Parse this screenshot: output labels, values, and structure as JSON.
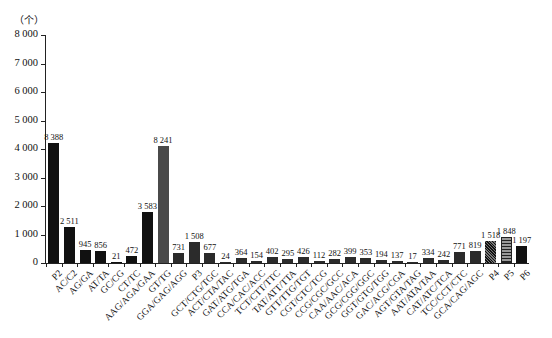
{
  "chart_data": {
    "type": "bar",
    "title": "",
    "xlabel": "",
    "ylabel": "（个）",
    "ylim": [
      0,
      8000
    ],
    "yticks": [
      "0",
      "1 000",
      "2 000",
      "3 000",
      "4 000",
      "5 000",
      "6 000",
      "7 000",
      "8 000"
    ],
    "grid": false,
    "legend": null,
    "note": "Bar heights are drawn at about half of the labeled value",
    "categories": [
      "P2",
      "AC/C2",
      "AG/GA",
      "AT/TA",
      "GC/CG",
      "CT/TC",
      "AAG/AGA/GAA",
      "GT/TG",
      "GGA/GAG/AGG",
      "P3",
      "GCT/CTG/TGC",
      "ACT/CTA/TAC",
      "GAT/ATG/TGA",
      "CCA/CAC/ACC",
      "TCT/CTT/TTC",
      "TAT/ATT/TTA",
      "GTT/TTG/TGT",
      "CGT/GTC/TCG",
      "CCG/CGC/GCC",
      "CAA/AAC/ACA",
      "GCG/CGG/GGC",
      "GGT/GTG/TGG",
      "GAC/ACG/CGA",
      "AGT/GTA/TAG",
      "AAT/ATA/TAA",
      "CAT/ATC/TCA",
      "TCC/CCT/CTC",
      "GCA/CAG/AGC",
      "P4",
      "P5",
      "P6"
    ],
    "value_labels": [
      "8 388",
      "2 511",
      "945",
      "856",
      "21",
      "472",
      "3 583",
      "8 241",
      "731",
      "1 508",
      "677",
      "24",
      "364",
      "154",
      "402",
      "295",
      "426",
      "112",
      "282",
      "399",
      "353",
      "194",
      "137",
      "17",
      "334",
      "242",
      "771",
      "819",
      "1 518",
      "1 848",
      "1 197"
    ],
    "values": [
      8388,
      2511,
      945,
      856,
      21,
      472,
      3583,
      8241,
      731,
      1508,
      677,
      24,
      364,
      154,
      402,
      295,
      426,
      112,
      282,
      399,
      353,
      194,
      137,
      17,
      334,
      242,
      771,
      819,
      1518,
      1848,
      1197
    ],
    "bar_styles": [
      "black",
      "black",
      "black",
      "black",
      "black",
      "black",
      "black",
      "gray",
      "mid",
      "mid",
      "mid",
      "mid",
      "mid",
      "mid",
      "mid",
      "mid",
      "mid",
      "mid",
      "mid",
      "mid",
      "mid",
      "mid",
      "mid",
      "mid",
      "mid",
      "mid",
      "mid",
      "mid",
      "hatch",
      "stripe",
      "black"
    ],
    "colors": {
      "black": "#111111",
      "gray": "#4a4a4a",
      "mid": "#2b2b2b"
    }
  }
}
